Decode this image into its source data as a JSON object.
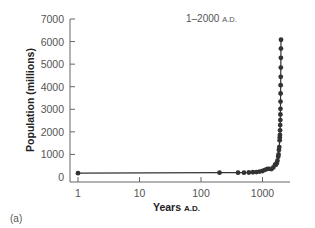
{
  "chart_data": {
    "type": "scatter",
    "title": "1–2000 A.D.",
    "title_main": "1–2000",
    "title_suffix": "A.D.",
    "xlabel": "Years A.D.",
    "xlabel_main": "Years",
    "xlabel_suffix": "A.D.",
    "ylabel": "Population (millions)",
    "panel_label": "(a)",
    "x_scale": "log",
    "xlim": [
      1,
      2000
    ],
    "ylim": [
      0,
      7000
    ],
    "x_ticks": [
      "1",
      "10",
      "100",
      "1000"
    ],
    "y_ticks": [
      "0",
      "1000",
      "2000",
      "3000",
      "4000",
      "5000",
      "6000",
      "7000"
    ],
    "grid": false,
    "series": [
      {
        "name": "World population",
        "color": "#333333",
        "x": [
          1,
          200,
          400,
          500,
          600,
          700,
          800,
          900,
          1000,
          1100,
          1200,
          1300,
          1400,
          1500,
          1600,
          1650,
          1700,
          1750,
          1800,
          1825,
          1850,
          1875,
          1900,
          1910,
          1920,
          1930,
          1940,
          1950,
          1955,
          1960,
          1965,
          1970,
          1975,
          1980,
          1985,
          1990,
          1995,
          2000
        ],
        "y": [
          170,
          190,
          190,
          190,
          200,
          210,
          220,
          240,
          265,
          320,
          360,
          360,
          350,
          425,
          545,
          545,
          610,
          720,
          900,
          1000,
          1200,
          1325,
          1625,
          1750,
          1860,
          2070,
          2300,
          2520,
          2770,
          3020,
          3340,
          3700,
          4070,
          4440,
          4850,
          5280,
          5690,
          6080
        ]
      }
    ]
  }
}
